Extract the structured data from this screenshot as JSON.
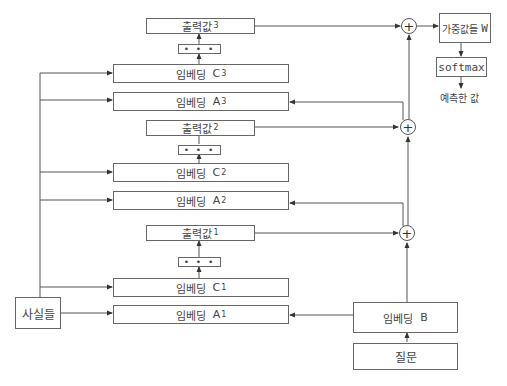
{
  "diagram": {
    "facts": {
      "label": "사실들"
    },
    "question": {
      "label": "질문"
    },
    "embedding_b": {
      "label": "임베딩",
      "var": "B"
    },
    "layers": [
      {
        "output": {
          "label": "출력값",
          "sub": "1"
        },
        "dots": "• • •",
        "embedding_c": {
          "label": "임베딩",
          "var": "C",
          "sub": "1"
        },
        "embedding_a": {
          "label": "임베딩",
          "var": "A",
          "sub": "1"
        }
      },
      {
        "output": {
          "label": "출력값",
          "sub": "2"
        },
        "dots": "• • •",
        "embedding_c": {
          "label": "임베딩",
          "var": "C",
          "sub": "2"
        },
        "embedding_a": {
          "label": "임베딩",
          "var": "A",
          "sub": "2"
        }
      },
      {
        "output": {
          "label": "출력값",
          "sub": "3"
        },
        "dots": "• • •",
        "embedding_c": {
          "label": "임베딩",
          "var": "C",
          "sub": "3"
        },
        "embedding_a": {
          "label": "임베딩",
          "var": "A",
          "sub": "3"
        }
      }
    ],
    "sum_nodes": [
      "+",
      "+",
      "+"
    ],
    "weights": {
      "label": "가중값들",
      "var": "W"
    },
    "softmax": {
      "label": "softmax"
    },
    "prediction": {
      "label": "예측한 값"
    }
  }
}
